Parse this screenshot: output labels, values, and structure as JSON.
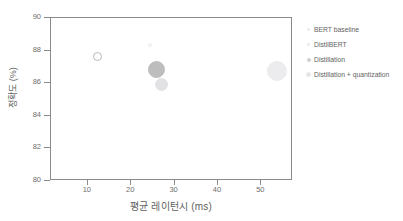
{
  "chart_data": {
    "type": "scatter",
    "title": "",
    "xlabel": "평균 레이턴시 (ms)",
    "ylabel": "정확도 (%)",
    "xlim": [
      1.5,
      57.3
    ],
    "ylim": [
      80,
      90
    ],
    "xticks": [
      10,
      20,
      30,
      40,
      50
    ],
    "yticks": [
      80,
      82,
      84,
      86,
      88,
      90
    ],
    "grid": false,
    "legend_position": "right",
    "series": [
      {
        "name": "BERT baseline",
        "x": 12.5,
        "y": 87.6,
        "marker": "open-circle",
        "size_px": 9,
        "color": "#ffffff",
        "edge_color": "#b8b8b8"
      },
      {
        "name": "DistilBERT",
        "x": 24.6,
        "y": 88.3,
        "marker": "filled-circle",
        "size_px": 4,
        "color": "#f4f4f6",
        "edge_color": "#f0f0f2"
      },
      {
        "name": "Distillation",
        "x": 26.1,
        "y": 86.8,
        "marker": "filled-circle",
        "size_px": 17,
        "color": "#bdbdbd",
        "edge_color": "#bdbdbd"
      },
      {
        "name": "Distillation + quantization",
        "x": 27.2,
        "y": 85.85,
        "marker": "filled-circle",
        "size_px": 13,
        "color": "#e2e2e4",
        "edge_color": "#e2e2e4"
      },
      {
        "name": "Distillation + quantization",
        "x": 53.9,
        "y": 86.7,
        "marker": "filled-circle",
        "size_px": 20,
        "color": "#ececee",
        "edge_color": "#ececee"
      }
    ]
  },
  "legend": {
    "items": [
      {
        "label": "BERT baseline",
        "marker_size": 3,
        "color": "#f2f2f4",
        "edge_color": "#e4e4e6"
      },
      {
        "label": "DistilBERT",
        "marker_size": 3,
        "color": "#f2f2f4",
        "edge_color": "#e4e4e6"
      },
      {
        "label": "Distillation",
        "marker_size": 4,
        "color": "#cfcfcf",
        "edge_color": "#cfcfcf"
      },
      {
        "label": "Distillation + quantization",
        "marker_size": 5,
        "color": "#e6e6e8",
        "edge_color": "#e6e6e8"
      }
    ]
  },
  "axes": {
    "x_tick_labels": [
      "10",
      "20",
      "30",
      "40",
      "50"
    ],
    "y_tick_labels": [
      "80",
      "82",
      "84",
      "86",
      "88",
      "90"
    ]
  },
  "colors": {
    "axis": "#8a8a8a",
    "text": "#5f5f5f",
    "background": "#ffffff"
  }
}
